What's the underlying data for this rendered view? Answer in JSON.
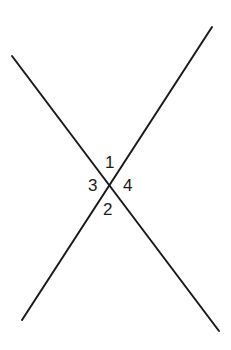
{
  "diagram": {
    "title": "",
    "lines": [
      {
        "name": "line-a",
        "from": "top-left",
        "to": "bottom-right"
      },
      {
        "name": "line-b",
        "from": "top-right",
        "to": "bottom-left"
      }
    ],
    "angle_labels": {
      "top": "1",
      "bottom": "2",
      "left": "3",
      "right": "4"
    },
    "colors": {
      "line": "#1a1a1a",
      "background": "#ffffff"
    }
  }
}
